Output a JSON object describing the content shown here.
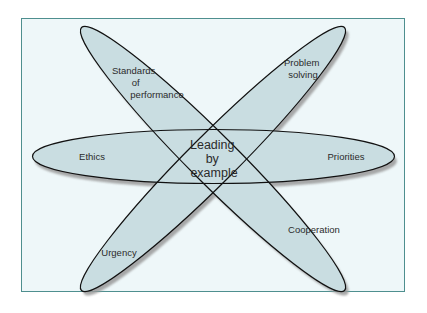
{
  "diagram": {
    "center": {
      "lines": [
        "Leading",
        "by",
        "example"
      ]
    },
    "petals": [
      {
        "id": "standards",
        "lines": [
          "Standards",
          "of",
          "performance"
        ]
      },
      {
        "id": "problem-solving",
        "lines": [
          "Problem",
          "solving"
        ]
      },
      {
        "id": "ethics",
        "lines": [
          "Ethics"
        ]
      },
      {
        "id": "priorities",
        "lines": [
          "Priorities"
        ]
      },
      {
        "id": "urgency",
        "lines": [
          "Urgency"
        ]
      },
      {
        "id": "cooperation",
        "lines": [
          "Cooperation"
        ]
      }
    ],
    "colors": {
      "frame_border": "#4e8f8f",
      "frame_fill": "#eef7f9",
      "ellipse_fill": "#c9dde1",
      "ellipse_stroke": "#111111",
      "shadow": "#9a9a9a"
    }
  }
}
